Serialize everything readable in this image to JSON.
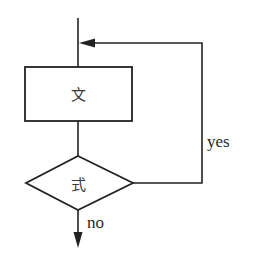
{
  "diagram": {
    "type": "flowchart",
    "nodes": [
      {
        "id": "statement",
        "shape": "rectangle",
        "label": "文"
      },
      {
        "id": "condition",
        "shape": "diamond",
        "label": "式"
      }
    ],
    "edges": [
      {
        "from": "entry",
        "to": "statement",
        "label": ""
      },
      {
        "from": "statement",
        "to": "condition",
        "label": ""
      },
      {
        "from": "condition",
        "to": "statement",
        "label": "yes"
      },
      {
        "from": "condition",
        "to": "exit",
        "label": "no"
      }
    ]
  },
  "labels": {
    "statement": "文",
    "condition": "式",
    "yes": "yes",
    "no": "no"
  },
  "colors": {
    "stroke": "#222222",
    "background": "#ffffff"
  }
}
